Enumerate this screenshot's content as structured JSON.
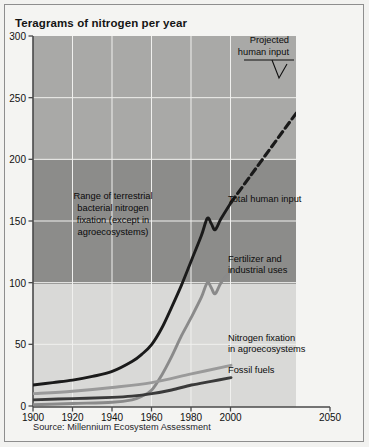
{
  "figure": {
    "title": "Teragrams of nitrogen per year",
    "source": "Source: Millennium Ecosystem Assessment",
    "background_color": "#f4f4f2",
    "border_color": "#8e8e8e"
  },
  "annotations": {
    "band_label": {
      "lines": [
        "Range of terrestrial",
        "bacterial nitrogen",
        "fixation (except in",
        "agroecosystems)"
      ]
    },
    "projected": {
      "lines": [
        "Projected",
        "human input"
      ]
    },
    "total_human_input": {
      "label": "Total human input"
    },
    "fertilizer": {
      "lines": [
        "Fertilizer and",
        "industrial uses"
      ]
    },
    "agro_fixation": {
      "lines": [
        "Nitrogen fixation",
        "in agroecosystems"
      ]
    },
    "fossil_fuels": {
      "label": "Fossil fuels"
    }
  },
  "chart_data": {
    "type": "line",
    "title": "Teragrams of nitrogen per year",
    "xlabel": "",
    "ylabel": "Teragrams of nitrogen per year",
    "xlim": [
      1900,
      2050
    ],
    "ylim": [
      0,
      300
    ],
    "xticks": [
      1900,
      1920,
      1940,
      1960,
      1980,
      2000,
      2050
    ],
    "yticks": [
      0,
      50,
      100,
      150,
      200,
      250,
      300
    ],
    "grid": true,
    "legend": "inline-annotations",
    "shaded_band": {
      "name": "Range of terrestrial bacterial nitrogen fixation (except in agroecosystems)",
      "ymin": 100,
      "ymax": 200,
      "color": "#8c8c8c"
    },
    "plot_background_upper": "#a8a8a8",
    "plot_background_lower": "#d8d8d6",
    "series": [
      {
        "name": "Total human input",
        "color": "#1a1a1a",
        "style": "solid",
        "x": [
          1900,
          1910,
          1920,
          1930,
          1940,
          1950,
          1955,
          1960,
          1965,
          1970,
          1975,
          1980,
          1985,
          1988,
          1990,
          1992,
          1995,
          2000
        ],
        "values": [
          17,
          19,
          21,
          24,
          28,
          36,
          42,
          50,
          63,
          80,
          98,
          118,
          138,
          152,
          148,
          143,
          152,
          165
        ]
      },
      {
        "name": "Projected human input",
        "color": "#1a1a1a",
        "style": "dashed",
        "x": [
          2000,
          2010,
          2020,
          2030,
          2040,
          2050
        ],
        "values": [
          165,
          187,
          209,
          231,
          252,
          272
        ]
      },
      {
        "name": "Fertilizer and industrial uses",
        "color": "#8a8a8a",
        "style": "solid",
        "x": [
          1900,
          1920,
          1940,
          1950,
          1955,
          1960,
          1965,
          1970,
          1975,
          1980,
          1985,
          1988,
          1990,
          1992,
          1995,
          2000
        ],
        "values": [
          1,
          2,
          3,
          5,
          8,
          13,
          25,
          40,
          57,
          72,
          88,
          100,
          96,
          91,
          100,
          110
        ]
      },
      {
        "name": "Nitrogen fixation in agroecosystems",
        "color": "#9a9a9a",
        "style": "solid",
        "x": [
          1900,
          1920,
          1940,
          1960,
          1980,
          2000
        ],
        "values": [
          10,
          12,
          15,
          19,
          26,
          33
        ]
      },
      {
        "name": "Fossil fuels",
        "color": "#3a3a3a",
        "style": "solid",
        "x": [
          1900,
          1920,
          1940,
          1950,
          1960,
          1970,
          1980,
          1990,
          2000
        ],
        "values": [
          5,
          6,
          7,
          8,
          10,
          13,
          17,
          20,
          23
        ]
      }
    ]
  }
}
